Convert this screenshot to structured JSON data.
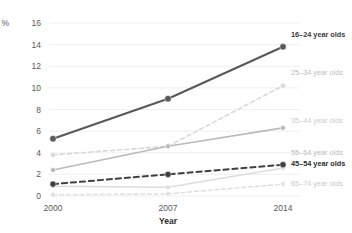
{
  "chart_data": {
    "type": "line",
    "title": "",
    "subtitle": "",
    "xlabel": "Year",
    "ylabel": "%",
    "x": [
      2000,
      2007,
      2014
    ],
    "categories": [
      "2000",
      "2007",
      "2014"
    ],
    "xtick_labels": [
      "2000",
      "2007",
      "2014"
    ],
    "ytick_labels": [
      "0",
      "2",
      "4",
      "6",
      "8",
      "10",
      "12",
      "14",
      "16"
    ],
    "yticks": [
      0,
      2,
      4,
      6,
      8,
      10,
      12,
      14,
      16
    ],
    "ylim": [
      0,
      16
    ],
    "xlim": [
      2000,
      2014
    ],
    "grid": true,
    "grid_axis": "y",
    "legend_position": "right-inline-at-last-point",
    "markers": true,
    "series": [
      {
        "name": "16–24 year olds",
        "values": [
          5.3,
          9.0,
          13.8
        ],
        "color": "#58595b",
        "style": "solid",
        "width": 2.1,
        "label_color": "#3b3c3e",
        "label_weight": "bold"
      },
      {
        "name": "25–34 year olds",
        "values": [
          3.8,
          4.6,
          10.2
        ],
        "color": "#d8d9da",
        "style": "dashed",
        "width": 1.6,
        "label_color": "#bdbec0",
        "label_weight": "normal"
      },
      {
        "name": "35–44 year olds",
        "values": [
          2.4,
          4.6,
          6.3
        ],
        "color": "#b9babc",
        "style": "solid",
        "width": 1.6,
        "label_color": "#cbcccd",
        "label_weight": "normal"
      },
      {
        "name": "55–64 year olds",
        "values": [
          0.9,
          0.8,
          2.6
        ],
        "color": "#dcdddd",
        "style": "solid",
        "width": 1.5,
        "label_color": "#b9babc",
        "label_weight": "normal"
      },
      {
        "name": "45–54 year olds",
        "values": [
          1.1,
          2.0,
          2.9
        ],
        "color": "#3f4042",
        "style": "dashed",
        "width": 2.0,
        "label_color": "#2b2b2b",
        "label_weight": "bold"
      },
      {
        "name": "65–74 year olds",
        "values": [
          0.1,
          0.2,
          1.1
        ],
        "color": "#dedfe0",
        "style": "dashed",
        "width": 1.5,
        "label_color": "#c9cacb",
        "label_weight": "normal"
      }
    ],
    "legend_entries": [
      {
        "label": "16–24 year olds",
        "y": 35,
        "color": "#3b3c3e",
        "weight": "bold"
      },
      {
        "label": "25–34 year olds",
        "y": 73,
        "color": "#bdbec0",
        "weight": "normal"
      },
      {
        "label": "35–44 year olds",
        "y": 121,
        "color": "#cbcccd",
        "weight": "normal"
      },
      {
        "label": "55–64 year olds",
        "y": 153,
        "color": "#b9babc",
        "weight": "normal"
      },
      {
        "label": "45–54 year olds",
        "y": 164,
        "color": "#2b2b2b",
        "weight": "bold"
      },
      {
        "label": "65–74 year olds",
        "y": 184,
        "color": "#c9cacb",
        "weight": "normal"
      }
    ]
  }
}
